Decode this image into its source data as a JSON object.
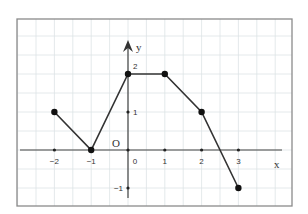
{
  "chart_data": {
    "type": "line",
    "title": "",
    "xlabel": "x",
    "ylabel": "y",
    "origin_label": "O",
    "x": [
      -2,
      -1,
      0,
      1,
      2,
      3
    ],
    "series": [
      {
        "name": "f(x)",
        "values": [
          1,
          0,
          2,
          2,
          1,
          -1
        ]
      }
    ],
    "x_tick_labels": [
      "-2",
      "-1",
      "0",
      "1",
      "2",
      "3"
    ],
    "y_tick_labels": [
      "-1",
      "1",
      "2"
    ],
    "xlim": [
      -3,
      4.5
    ],
    "ylim": [
      -1.5,
      3.5
    ],
    "grid": true,
    "grid_step": 0.5,
    "legend": "none",
    "colors": {
      "line": "#333333",
      "grid": "#dde3e6",
      "frame": "#8a8a8a",
      "axis": "#444444"
    }
  }
}
